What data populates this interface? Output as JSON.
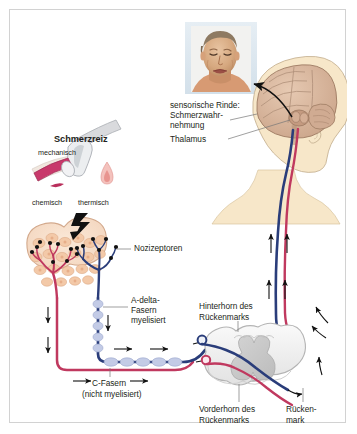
{
  "figure": {
    "type": "anatomical-diagram",
    "language": "de",
    "background_color": "#ffffff",
    "border_color": "#d2d2d2"
  },
  "colors": {
    "a_delta_fiber": "#2a3d7a",
    "c_fiber": "#c0395f",
    "myelin_sheath": "#c3cbe6",
    "nociceptor_dot": "#111111",
    "tissue_fill": "#f6ddc9",
    "tissue_outline": "#d9b59a",
    "skin_tone": "#f5e3c8",
    "brain_tone": "#d9b9a2",
    "spinal_gray": "#c9c9c9",
    "spinal_white": "#efefef",
    "arrow_black": "#111111",
    "text": "#231f20",
    "photo_backdrop": "#dce7ef"
  },
  "labels": {
    "stimulus_title": "Schmerzreiz",
    "stimulus_mechanical": "mechanisch",
    "stimulus_chemical": "chemisch",
    "stimulus_thermal": "thermisch",
    "nociceptors": "Nozizeptoren",
    "a_delta_line1": "A-delta-",
    "a_delta_line2": "Fasern",
    "a_delta_line3": "myelisiert",
    "c_fiber_line1": "C-Fasern",
    "c_fiber_line2": "(nicht myelisiert)",
    "dorsal_horn_line1": "Hinterhorn des",
    "dorsal_horn_line2": "Rückenmarks",
    "ventral_horn_line1": "Vorderhorn des",
    "ventral_horn_line2": "Rückenmarks",
    "spinal_cord_line1": "Rücken-",
    "spinal_cord_line2": "mark",
    "cortex_line1": "sensorische Rinde:",
    "cortex_line2": "Schmerzwahr-",
    "cortex_line3": "nehmung",
    "thalamus": "Thalamus"
  },
  "icons": {
    "photo": "pained-face-photo",
    "lightning": "lightning-bolt-stimulus-icon",
    "hammer": "hammer-mechanical-icon",
    "syringe": "syringe-chemical-icon",
    "flame": "flame-thermal-icon",
    "arrow_up": "arrow-up-icon",
    "arrow_down": "arrow-down-icon",
    "arrow_right": "arrow-right-icon"
  }
}
